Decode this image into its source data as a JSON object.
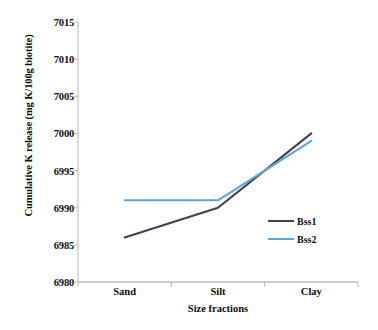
{
  "chart_data": {
    "type": "line",
    "title": "",
    "xlabel": "Size fractions",
    "ylabel": "Cumulative K release (mg K/100g biotite)",
    "categories": [
      "Sand",
      "Silt",
      "Clay"
    ],
    "ylim": [
      6980,
      7015
    ],
    "yticks": [
      6980,
      6985,
      6990,
      6995,
      7000,
      7005,
      7010,
      7015
    ],
    "ytick_labels": [
      "6980",
      "6985",
      "6990",
      "6995",
      "7000",
      "7005",
      "7010",
      "7015"
    ],
    "grid": false,
    "legend_position": "inside-bottom-right",
    "series": [
      {
        "name": "Bss1",
        "values": [
          6986,
          6990,
          7000
        ],
        "color": "#4A3A55"
      },
      {
        "name": "Bss2",
        "values": [
          6991,
          6991,
          6999
        ],
        "color": "#5BA7D4"
      }
    ]
  },
  "axis": {
    "line_color": "#BFBFBF",
    "tick_color": "#BFBFBF"
  }
}
